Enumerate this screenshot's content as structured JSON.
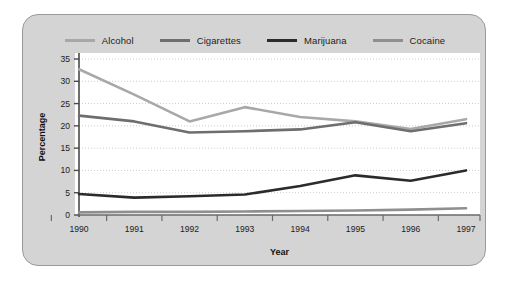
{
  "chart_data": {
    "type": "line",
    "title": "",
    "subtitle": "",
    "xlabel": "Year",
    "ylabel": "Percentage",
    "categories": [
      "1990",
      "1991",
      "1992",
      "1993",
      "1994",
      "1995",
      "1996",
      "1997"
    ],
    "x": [
      1990,
      1991,
      1992,
      1993,
      1994,
      1995,
      1996,
      1997
    ],
    "xlim": [
      1990,
      1997
    ],
    "ylim": [
      0,
      35
    ],
    "yticks": [
      0,
      5,
      10,
      15,
      20,
      25,
      30,
      35
    ],
    "ytick_labels": [
      "0",
      "5",
      "10",
      "15",
      "20",
      "25",
      "30",
      "35"
    ],
    "xticks": [
      1990,
      1991,
      1992,
      1993,
      1994,
      1995,
      1996,
      1997
    ],
    "xtick_labels": [
      "1990",
      "1991",
      "1992",
      "1993",
      "1994",
      "1995",
      "1996",
      "1997"
    ],
    "grid": "horizontal-dotted",
    "legend_position": "top-center",
    "plot_background": "#ffffff",
    "panel_background": "#d4d4d4",
    "series": [
      {
        "name": "Alcohol",
        "color": "#a8a8a8",
        "values": [
          32.7,
          27.0,
          21.0,
          24.2,
          22.0,
          21.0,
          19.3,
          21.5
        ]
      },
      {
        "name": "Cigarettes",
        "color": "#6e6e6e",
        "values": [
          22.3,
          21.0,
          18.5,
          18.8,
          19.2,
          20.8,
          18.8,
          20.6
        ]
      },
      {
        "name": "Marijuana",
        "color": "#2b2b2b",
        "values": [
          4.7,
          3.9,
          4.2,
          4.6,
          6.5,
          8.9,
          7.7,
          10.0
        ]
      },
      {
        "name": "Cocaine",
        "color": "#8f8f8f",
        "values": [
          0.6,
          0.7,
          0.7,
          0.8,
          0.9,
          1.0,
          1.2,
          1.5
        ]
      }
    ]
  },
  "legend": {
    "items": [
      {
        "label": "Alcohol",
        "color": "#a8a8a8"
      },
      {
        "label": "Cigarettes",
        "color": "#6e6e6e"
      },
      {
        "label": "Marijuana",
        "color": "#2b2b2b"
      },
      {
        "label": "Cocaine",
        "color": "#8f8f8f"
      }
    ]
  },
  "axes": {
    "y_title": "Percentage",
    "x_title": "Year"
  }
}
